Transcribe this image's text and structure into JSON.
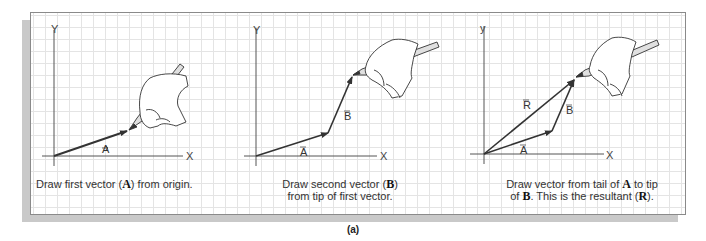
{
  "figure": {
    "label": "(a)",
    "panels": [
      {
        "id": "panel-1",
        "caption_parts": [
          "Draw first vector (",
          "A",
          ") from origin."
        ],
        "axis_x": "X",
        "axis_y": "Y",
        "vectors": [
          {
            "name": "A",
            "label": "A⃗",
            "from": [
              54,
              156
            ],
            "to": [
              127,
              131
            ]
          }
        ]
      },
      {
        "id": "panel-2",
        "caption_line1_parts": [
          "Draw second vector (",
          "B",
          ")"
        ],
        "caption_line2": "from tip of first vector.",
        "axis_x": "X",
        "axis_y": "Y",
        "vectors": [
          {
            "name": "A",
            "label": "A⃗",
            "from": [
              256,
              156
            ],
            "to": [
              328,
              133
            ]
          },
          {
            "name": "B",
            "label": "B⃗",
            "from": [
              328,
              133
            ],
            "to": [
              352,
              77
            ]
          }
        ]
      },
      {
        "id": "panel-3",
        "caption_line1_parts": [
          "Draw vector from tail of ",
          "A",
          " to tip"
        ],
        "caption_line2_parts": [
          "of ",
          "B",
          ". This is the resultant (",
          "R",
          ")."
        ],
        "axis_x": "X",
        "axis_y": "Y",
        "vectors": [
          {
            "name": "A",
            "label": "A⃗",
            "from": [
              484,
              154
            ],
            "to": [
              552,
              131
            ]
          },
          {
            "name": "B",
            "label": "B⃗",
            "from": [
              552,
              131
            ],
            "to": [
              574,
              80
            ]
          },
          {
            "name": "R",
            "label": "R⃗",
            "from": [
              484,
              154
            ],
            "to": [
              574,
              80
            ]
          }
        ]
      }
    ],
    "colors": {
      "grid": "#e4e4e4",
      "frame": "#8a8a8a",
      "shadow": "#c9c9c9",
      "ink": "#333333"
    }
  },
  "labels": {
    "p1": {
      "y": "Y",
      "x": "X",
      "a": "A"
    },
    "p2": {
      "y": "Y",
      "x": "X",
      "a": "A",
      "b": "B"
    },
    "p3": {
      "y": "y",
      "x": "X",
      "a": "A",
      "b": "B",
      "r": "R"
    }
  },
  "captions": {
    "p1": {
      "t1": "Draw first vector (",
      "b1": "A",
      "t2": ") from origin."
    },
    "p2": {
      "t1": "Draw second vector (",
      "b1": "B",
      "t2": ")",
      "line2": "from tip of first vector."
    },
    "p3": {
      "t1": "Draw vector from tail of ",
      "b1": "A",
      "t2": " to tip",
      "l2a": "of ",
      "l2b": "B",
      "l2c": ". This is the resultant (",
      "l2d": "R",
      "l2e": ")."
    }
  }
}
